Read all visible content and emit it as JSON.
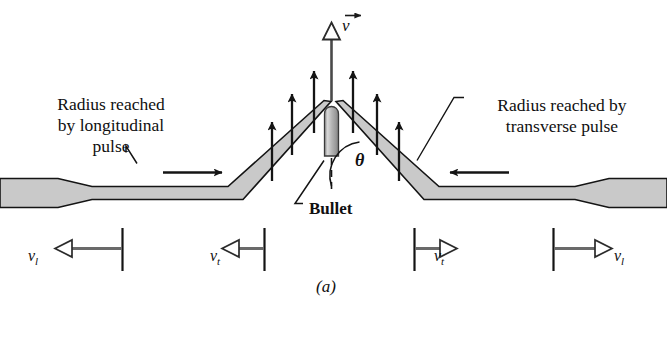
{
  "figure": {
    "caption": "(a)"
  },
  "labels": {
    "left_radius": "Radius reached\nby longitudinal\npulse",
    "right_radius": "Radius reached by\ntransverse pulse",
    "bullet": "Bullet",
    "angle": "θ",
    "velocity_vector": "v"
  },
  "speed_markers": [
    {
      "name": "vl-left",
      "symbol": "v",
      "subscript": "l",
      "direction": "left"
    },
    {
      "name": "vt-left",
      "symbol": "v",
      "subscript": "t",
      "direction": "left"
    },
    {
      "name": "vt-right",
      "symbol": "v",
      "subscript": "t",
      "direction": "right"
    },
    {
      "name": "vl-right",
      "symbol": "v",
      "subscript": "l",
      "direction": "right"
    }
  ],
  "colors": {
    "string_fill": "#c9c9c9",
    "outline": "#141414",
    "arrow": "#1a1a1a",
    "text": "#100f10",
    "background": "#ffffff"
  }
}
